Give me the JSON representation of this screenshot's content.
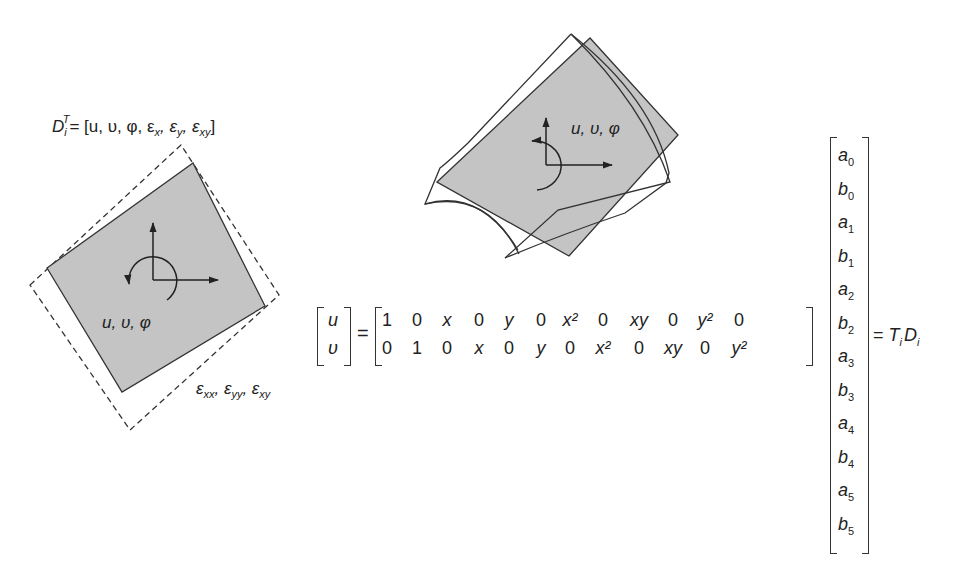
{
  "figure": {
    "left_element": {
      "dof_vector_label": "D_i^T = [u, υ, φ, ε_x, ε_y, ε_xy]",
      "dof_vector_parts": {
        "D": "D",
        "sub": "i",
        "sup": "T",
        "rest": "= [u, υ, φ, ε",
        "x": "x",
        "c1": ", ε",
        "y": "y",
        "c2": ", ε",
        "xy": "xy",
        "end": "]"
      },
      "rigid_body_label": "u, υ, φ",
      "strain_label_parts": {
        "e1": "ε",
        "s1": "xx",
        "e2": ", ε",
        "s2": "yy",
        "e3": ", ε",
        "s3": "xy"
      },
      "strain_label": "ε_xx, ε_yy, ε_xy",
      "fill_color": "#c4c4c4",
      "outline_style": "dashed"
    },
    "middle_element": {
      "rigid_body_label": "u, υ, φ",
      "fill_color": "#c4c4c4"
    },
    "equation": {
      "lhs": [
        "u",
        "υ"
      ],
      "equals": "=",
      "matrix_rows": [
        [
          "1",
          "0",
          "x",
          "0",
          "y",
          "0",
          "x²",
          "0",
          "xy",
          "0",
          "y²",
          "0"
        ],
        [
          "0",
          "1",
          "0",
          "x",
          "0",
          "y",
          "0",
          "x²",
          "0",
          "xy",
          "0",
          "y²"
        ]
      ],
      "coefficients": [
        "a0",
        "b0",
        "a1",
        "b1",
        "a2",
        "b2",
        "a3",
        "b3",
        "a4",
        "b4",
        "a5",
        "b5"
      ],
      "coeff_parts": [
        {
          "v": "a",
          "s": "0"
        },
        {
          "v": "b",
          "s": "0"
        },
        {
          "v": "a",
          "s": "1"
        },
        {
          "v": "b",
          "s": "1"
        },
        {
          "v": "a",
          "s": "2"
        },
        {
          "v": "b",
          "s": "2"
        },
        {
          "v": "a",
          "s": "3"
        },
        {
          "v": "b",
          "s": "3"
        },
        {
          "v": "a",
          "s": "4"
        },
        {
          "v": "b",
          "s": "4"
        },
        {
          "v": "a",
          "s": "5"
        },
        {
          "v": "b",
          "s": "5"
        }
      ],
      "rhs_parts": {
        "eq": "= ",
        "T": "T",
        "Ti": "i",
        "D": "D",
        "Di": "i"
      },
      "rhs": "= T_i D_i"
    }
  }
}
